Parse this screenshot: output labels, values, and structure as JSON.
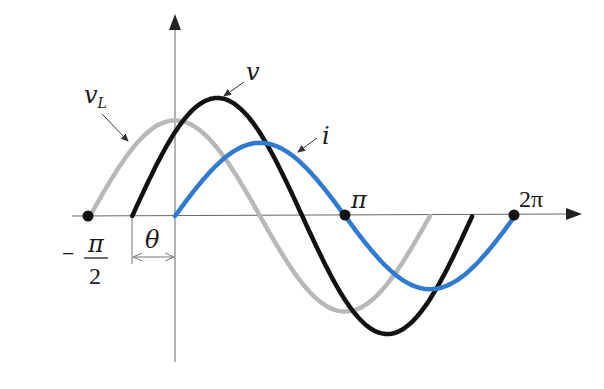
{
  "chart_data": {
    "type": "line",
    "title": "",
    "xlabel": "",
    "ylabel": "",
    "x_unit": "radians",
    "tick_labels": [
      "-π/2",
      "π",
      "2π"
    ],
    "tick_positions": [
      -1.5708,
      3.1416,
      6.2832
    ],
    "grid": false,
    "legend": "inline curve labels",
    "angle_annotation": {
      "label": "θ",
      "from": -0.79,
      "to": 0
    },
    "series": [
      {
        "name": "v_L",
        "color": "#b8b8b8",
        "phase_shift": 1.5708,
        "amplitude": 0.81,
        "x_start": -1.5708,
        "x_end": 4.71,
        "description": "leads i by π/2, peak at x=0"
      },
      {
        "name": "v",
        "color": "#111111",
        "phase_shift": 0.79,
        "amplitude": 1.0,
        "x_start": -0.79,
        "x_end": 5.49,
        "description": "leads i by θ"
      },
      {
        "name": "i",
        "color": "#2f7bd0",
        "phase_shift": 0,
        "amplitude": 0.62,
        "x_start": 0,
        "x_end": 6.2832,
        "description": "reference current"
      }
    ]
  },
  "labels": {
    "v": "v",
    "vL_main": "v",
    "vL_sub": "L",
    "i": "i",
    "theta": "θ",
    "pi": "π",
    "two_pi": "2π",
    "neg_sign": "−",
    "half_num": "π",
    "half_den": "2"
  },
  "colors": {
    "axis": "#555555",
    "v": "#111111",
    "v_L": "#b8b8b8",
    "i": "#2f7bd0",
    "dot": "#111111"
  }
}
